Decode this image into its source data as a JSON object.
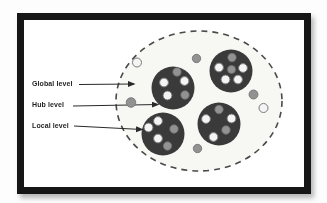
{
  "figure": {
    "type": "network-levels-diagram",
    "legend": {
      "items": [
        {
          "id": "global",
          "label": "Global level",
          "arrow": {
            "x1": 79,
            "y1": 84.5,
            "x2": 134,
            "y2": 84
          }
        },
        {
          "id": "hub",
          "label": "Hub level",
          "arrow": {
            "x1": 73,
            "y1": 106,
            "x2": 158,
            "y2": 104.5
          }
        },
        {
          "id": "local",
          "label": "Local level",
          "arrow": {
            "x1": 74,
            "y1": 126,
            "x2": 142,
            "y2": 129.5
          }
        }
      ]
    },
    "colors": {
      "frame": "#161616",
      "canvas": "#ffffff",
      "hub_fill": "#3a3a3a",
      "node_white": "#f4f4f4",
      "node_white_rim": "#7a7a7a",
      "node_gray": "#929292",
      "node_gray_rim": "#6e6e6e",
      "dash": "#4a4a4a",
      "inner_tint": "#f7f7f4",
      "arrow": "#2a2a2a",
      "label_text": "#1f1f1f"
    },
    "diagram": {
      "global_circle": {
        "cx": 199,
        "cy": 101,
        "rx": 83,
        "ry": 70
      },
      "hubs": [
        {
          "name": "hub-top-right",
          "cx": 231,
          "cy": 71,
          "r": 21.5,
          "nodes": [
            {
              "x": 232,
              "y": 57.5,
              "r": 4.2,
              "color": "gray"
            },
            {
              "x": 219,
              "y": 67.5,
              "r": 4.4,
              "color": "white"
            },
            {
              "x": 243,
              "y": 68,
              "r": 4.4,
              "color": "white"
            },
            {
              "x": 231.5,
              "y": 69.5,
              "r": 4.0,
              "color": "gray"
            },
            {
              "x": 225.5,
              "y": 79.5,
              "r": 4.4,
              "color": "white"
            },
            {
              "x": 238,
              "y": 79.5,
              "r": 4.4,
              "color": "white"
            }
          ]
        },
        {
          "name": "hub-left",
          "cx": 173,
          "cy": 88,
          "r": 21.5,
          "nodes": [
            {
              "x": 177,
              "y": 72,
              "r": 4.2,
              "color": "gray"
            },
            {
              "x": 164,
              "y": 82.5,
              "r": 4.4,
              "color": "white"
            },
            {
              "x": 184.5,
              "y": 81,
              "r": 4.4,
              "color": "white"
            },
            {
              "x": 167.5,
              "y": 95.5,
              "r": 4.4,
              "color": "white"
            },
            {
              "x": 185,
              "y": 95,
              "r": 4.2,
              "color": "gray"
            }
          ]
        },
        {
          "name": "hub-bottom-left",
          "cx": 163,
          "cy": 134,
          "r": 21.5,
          "nodes": [
            {
              "x": 158,
              "y": 121,
              "r": 4.4,
              "color": "white"
            },
            {
              "x": 148.5,
              "y": 127.5,
              "r": 4.4,
              "color": "white"
            },
            {
              "x": 174,
              "y": 129,
              "r": 4.2,
              "color": "gray"
            },
            {
              "x": 158,
              "y": 138.5,
              "r": 4.4,
              "color": "white"
            },
            {
              "x": 167.5,
              "y": 146,
              "r": 4.2,
              "color": "gray"
            }
          ]
        },
        {
          "name": "hub-bottom-right",
          "cx": 219,
          "cy": 124,
          "r": 21.5,
          "nodes": [
            {
              "x": 219,
              "y": 109.5,
              "r": 4.2,
              "color": "gray"
            },
            {
              "x": 206,
              "y": 119,
              "r": 4.4,
              "color": "white"
            },
            {
              "x": 231.5,
              "y": 118.5,
              "r": 4.4,
              "color": "white"
            },
            {
              "x": 226,
              "y": 130,
              "r": 4.2,
              "color": "gray"
            },
            {
              "x": 213.5,
              "y": 137,
              "r": 4.4,
              "color": "white"
            }
          ]
        }
      ],
      "isolated_nodes": [
        {
          "x": 137,
          "y": 62.5,
          "r": 4.5,
          "color": "white"
        },
        {
          "x": 196.5,
          "y": 58.5,
          "r": 4.2,
          "color": "gray"
        },
        {
          "x": 131,
          "y": 102.5,
          "r": 4.8,
          "color": "gray"
        },
        {
          "x": 253.5,
          "y": 94.5,
          "r": 4.5,
          "color": "gray"
        },
        {
          "x": 263.5,
          "y": 108,
          "r": 4.5,
          "color": "white"
        },
        {
          "x": 197.5,
          "y": 148.5,
          "r": 4.2,
          "color": "gray"
        }
      ]
    }
  }
}
